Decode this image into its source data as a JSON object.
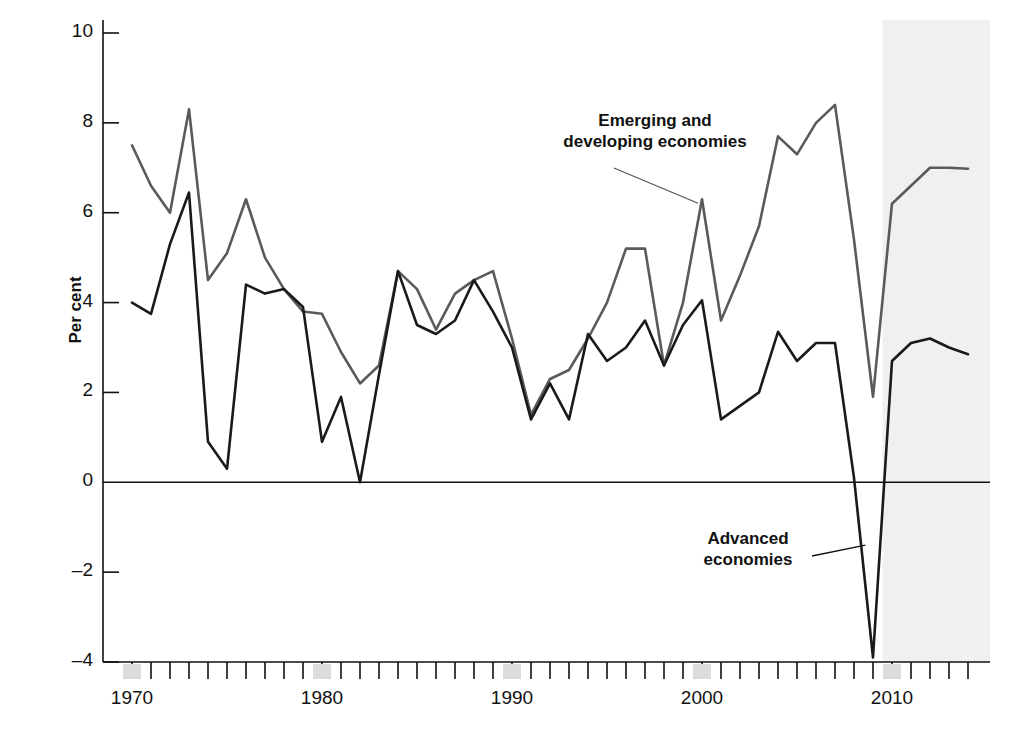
{
  "chart_data": {
    "type": "line",
    "title": "",
    "subtitle": "",
    "xlabel": "",
    "ylabel": "Per cent",
    "xlim": [
      1970,
      2014
    ],
    "ylim": [
      -4,
      10
    ],
    "ytick_labels": [
      "10",
      "8",
      "6",
      "4",
      "2",
      "0",
      "–2",
      "–4"
    ],
    "ytick_values": [
      10,
      8,
      6,
      4,
      2,
      0,
      -2,
      -4
    ],
    "xtick_labels": [
      "1970",
      "1980",
      "1990",
      "2000",
      "2010"
    ],
    "xtick_values": [
      1970,
      1980,
      1990,
      2000,
      2010
    ],
    "minor_xticks_every": 1,
    "grid": false,
    "legend_position": "inline-annotations",
    "zero_line": true,
    "shaded_forecast": {
      "label": "",
      "start": 2009.5,
      "end": 2014,
      "color": "#f0f0f0"
    },
    "x": [
      1970,
      1971,
      1972,
      1973,
      1974,
      1975,
      1976,
      1977,
      1978,
      1979,
      1980,
      1981,
      1982,
      1983,
      1984,
      1985,
      1986,
      1987,
      1988,
      1989,
      1990,
      1991,
      1992,
      1993,
      1994,
      1995,
      1996,
      1997,
      1998,
      1999,
      2000,
      2001,
      2002,
      2003,
      2004,
      2005,
      2006,
      2007,
      2008,
      2009,
      2010,
      2011,
      2012,
      2013,
      2014
    ],
    "series": [
      {
        "name": "Emerging and developing economies",
        "color": "#5a5a5a",
        "values": [
          7.5,
          6.6,
          6.0,
          8.3,
          4.5,
          5.1,
          6.3,
          5.0,
          4.3,
          3.8,
          3.75,
          2.9,
          2.2,
          2.6,
          4.7,
          4.3,
          3.4,
          4.2,
          4.5,
          4.7,
          3.2,
          1.5,
          2.3,
          2.5,
          3.2,
          4.0,
          5.2,
          5.2,
          2.6,
          4.0,
          6.3,
          3.6,
          4.6,
          5.7,
          7.7,
          7.3,
          8.0,
          8.4,
          5.4,
          1.9,
          6.2,
          6.6,
          7.0,
          7.0,
          6.98
        ]
      },
      {
        "name": "Advanced economies",
        "color": "#1a1a1a",
        "values": [
          4.0,
          3.75,
          5.3,
          6.45,
          0.9,
          0.3,
          4.4,
          4.2,
          4.3,
          3.9,
          0.9,
          1.9,
          0.0,
          2.4,
          4.7,
          3.5,
          3.3,
          3.6,
          4.5,
          3.8,
          3.0,
          1.4,
          2.2,
          1.4,
          3.3,
          2.7,
          3.0,
          3.6,
          2.6,
          3.5,
          4.05,
          1.4,
          1.7,
          2.0,
          3.35,
          2.7,
          3.1,
          3.1,
          0.1,
          -3.9,
          2.7,
          3.1,
          3.2,
          3.0,
          2.85
        ]
      }
    ],
    "annotations": [
      {
        "name": "emerging-label",
        "text_line1": "Emerging and",
        "text_line2": "developing economies",
        "target_year": 2000,
        "target_value": 6.3
      },
      {
        "name": "advanced-label",
        "text_line1": "Advanced",
        "text_line2": "economies",
        "target_year": 2008.6,
        "target_value": -1.4
      }
    ],
    "recession_bands_on_axis": [
      1970,
      1980,
      1990,
      2000,
      2010
    ]
  }
}
